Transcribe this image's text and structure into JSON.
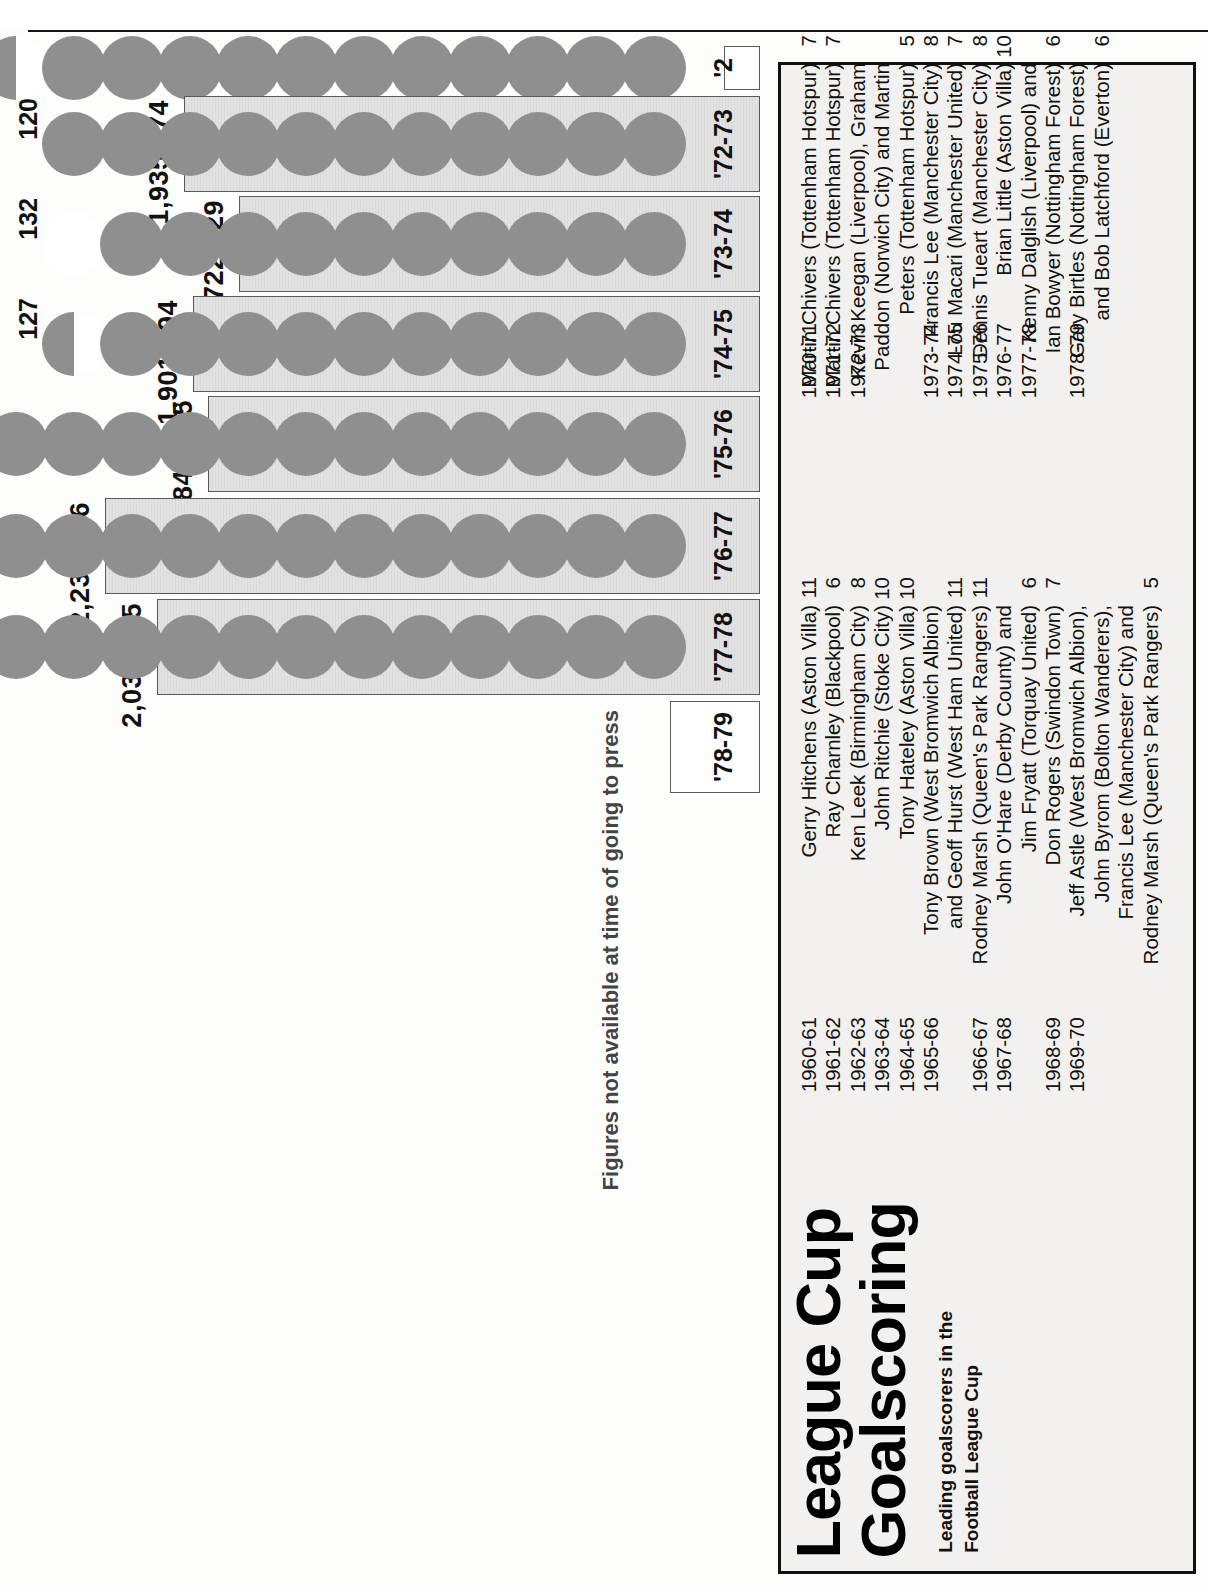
{
  "page": {
    "title": "League Cup Goalscoring",
    "title_line1": "League Cup",
    "title_line2": "Goalscoring",
    "subtitle_line1": "Leading goalscorers in the",
    "subtitle_line2": "Football League Cup",
    "footnote": "Figures not available at time of going to press"
  },
  "chart_data": {
    "type": "bar",
    "xlabel": "",
    "ylabel": "",
    "categories": [
      "'2",
      "'72-73",
      "'73-74",
      "'74-75",
      "'75-76",
      "'76-77",
      "'77-78",
      "'78-79"
    ],
    "series": [
      {
        "name": "Total attendance",
        "unit": "spectators",
        "values": [
          null,
          1935474,
          1722629,
          1901094,
          1841735,
          2236636,
          2038295,
          null
        ],
        "labels": [
          "",
          "1,935,474",
          "1,722,629",
          "1,901,094",
          "1,841,735",
          "2,236,636",
          "2,038,295",
          ""
        ]
      },
      {
        "name": "Goals scored",
        "unit": "goals",
        "values": [
          123,
          120,
          132,
          127,
          140,
          147,
          148,
          null
        ],
        "labels": [
          "123",
          "120",
          "132",
          "127",
          "140",
          "147",
          "148",
          ""
        ]
      }
    ],
    "note": "Figures not available at time of going to press",
    "legend_position": "none",
    "grid": false
  },
  "bars": [
    {
      "season": "'2",
      "attendance_label": "",
      "attendance": null,
      "goals_label": "123",
      "goals": 123,
      "balls": 12,
      "half_top": true,
      "partial": false
    },
    {
      "season": "'72-73",
      "attendance_label": "1,935,474",
      "attendance": 1935474,
      "goals_label": "120",
      "goals": 120,
      "balls": 11,
      "half_top": false,
      "partial": false
    },
    {
      "season": "'73-74",
      "attendance_label": "1,722,629",
      "attendance": 1722629,
      "goals_label": "132",
      "goals": 132,
      "balls": 11,
      "half_top": false,
      "partial": true
    },
    {
      "season": "'74-75",
      "attendance_label": "1,901,094",
      "attendance": 1901094,
      "goals_label": "127",
      "goals": 127,
      "balls": 11,
      "half_top": true,
      "partial": false
    },
    {
      "season": "'75-76",
      "attendance_label": "1,841,735",
      "attendance": 1841735,
      "goals_label": "140",
      "goals": 140,
      "balls": 12,
      "half_top": false,
      "partial": false
    },
    {
      "season": "'76-77",
      "attendance_label": "2,236,636",
      "attendance": 2236636,
      "goals_label": "147",
      "goals": 147,
      "balls": 13,
      "half_top": true,
      "partial": false
    },
    {
      "season": "'77-78",
      "attendance_label": "2,038,295",
      "attendance": 2038295,
      "goals_label": "148",
      "goals": 148,
      "balls": 13,
      "half_top": true,
      "partial": false
    },
    {
      "season": "'78-79",
      "attendance_label": "",
      "attendance": null,
      "goals_label": "",
      "goals": null,
      "balls": 0,
      "half_top": false,
      "partial": false
    }
  ],
  "scorers": {
    "column_left": [
      {
        "season": "1960-61",
        "name": "Gerry Hitchens (Aston Villa)",
        "goals": "11"
      },
      {
        "season": "1961-62",
        "name": "Ray Charnley (Blackpool)",
        "goals": "6"
      },
      {
        "season": "1962-63",
        "name": "Ken Leek (Birmingham City)",
        "goals": "8"
      },
      {
        "season": "1963-64",
        "name": "John Ritchie (Stoke City)",
        "goals": "10"
      },
      {
        "season": "1964-65",
        "name": "Tony Hateley (Aston Villa)",
        "goals": "10"
      },
      {
        "season": "1965-66",
        "name": "Tony Brown (West Bromwich Albion)",
        "goals": ""
      },
      {
        "season": "",
        "name": "and Geoff Hurst (West Ham United)",
        "goals": "11"
      },
      {
        "season": "1966-67",
        "name": "Rodney Marsh (Queen's Park Rangers)",
        "goals": "11"
      },
      {
        "season": "1967-68",
        "name": "John O'Hare (Derby County) and",
        "goals": ""
      },
      {
        "season": "",
        "name": "Jim Fryatt (Torquay United)",
        "goals": "6"
      },
      {
        "season": "1968-69",
        "name": "Don Rogers (Swindon Town)",
        "goals": "7"
      },
      {
        "season": "1969-70",
        "name": "Jeff Astle (West Bromwich Albion),",
        "goals": ""
      },
      {
        "season": "",
        "name": "John Byrom (Bolton Wanderers),",
        "goals": ""
      },
      {
        "season": "",
        "name": "Francis Lee (Manchester City) and",
        "goals": ""
      },
      {
        "season": "",
        "name": "Rodney Marsh (Queen's Park Rangers)",
        "goals": "5"
      }
    ],
    "column_right": [
      {
        "season": "1970-71",
        "name": "Martin Chivers (Tottenham Hotspur)",
        "goals": "7"
      },
      {
        "season": "1971-72",
        "name": "Martin Chivers (Tottenham Hotspur)",
        "goals": "7"
      },
      {
        "season": "1972-73",
        "name": "Kevin Keegan (Liverpool), Graham",
        "goals": ""
      },
      {
        "season": "",
        "name": "Paddon (Norwich City) and Martin",
        "goals": ""
      },
      {
        "season": "",
        "name": "Peters (Tottenham Hotspur)",
        "goals": "5"
      },
      {
        "season": "1973-74",
        "name": "Francis Lee (Manchester City)",
        "goals": "8"
      },
      {
        "season": "1974-75",
        "name": "Lou Macari (Manchester United)",
        "goals": "7"
      },
      {
        "season": "1975-76",
        "name": "Dennis Tueart (Manchester City)",
        "goals": "8"
      },
      {
        "season": "1976-77",
        "name": "Brian Little (Aston Villa)",
        "goals": "10"
      },
      {
        "season": "1977-78",
        "name": "Kenny Dalglish (Liverpool) and",
        "goals": ""
      },
      {
        "season": "",
        "name": "Ian Bowyer (Nottingham Forest)",
        "goals": "6"
      },
      {
        "season": "1978-79",
        "name": "Gary Birtles (Nottingham Forest)",
        "goals": ""
      },
      {
        "season": "",
        "name": "and Bob Latchford (Everton)",
        "goals": "6"
      }
    ]
  },
  "colors": {
    "ball_grey": "#8f8f8f",
    "bar_fill": "#e2e2e2",
    "bar_stroke": "#5a5a5a",
    "panel_bg": "#f2f1ef",
    "ink": "#111111"
  }
}
